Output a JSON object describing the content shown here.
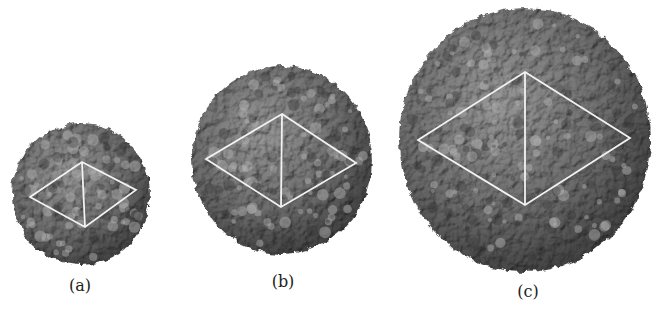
{
  "figure": {
    "background": "#ffffff",
    "capsid_color": "#7a7a7a",
    "rhombus_color": "#f2f2f2",
    "panels": [
      {
        "id": "a",
        "label": "(a)",
        "center": [
          81,
          194
        ],
        "radius": [
          69,
          71
        ],
        "rhombus": {
          "top": [
            82,
            162
          ],
          "left": [
            30,
            197
          ],
          "right": [
            136,
            190
          ],
          "bottom": [
            85,
            227
          ]
        },
        "label_pos": [
          80,
          276
        ]
      },
      {
        "id": "b",
        "label": "(b)",
        "center": [
          282,
          160
        ],
        "radius": [
          90,
          94
        ],
        "rhombus": {
          "top": [
            282,
            114
          ],
          "left": [
            206,
            159
          ],
          "right": [
            356,
            163
          ],
          "bottom": [
            281,
            207
          ]
        },
        "label_pos": [
          283,
          272
        ]
      },
      {
        "id": "c",
        "label": "(c)",
        "center": [
          525,
          140
        ],
        "radius": [
          126,
          132
        ],
        "rhombus": {
          "top": [
            525,
            72
          ],
          "left": [
            418,
            140
          ],
          "right": [
            630,
            138
          ],
          "bottom": [
            525,
            205
          ]
        },
        "label_pos": [
          528,
          282
        ]
      }
    ]
  }
}
